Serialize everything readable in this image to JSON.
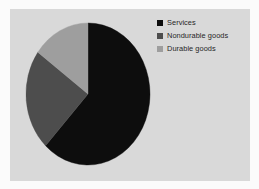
{
  "figure": {
    "background_color": "#fbfbfb",
    "plot_background_color": "#d9d9d9"
  },
  "legend": {
    "position": "top-right",
    "entries": [
      {
        "label": "Services",
        "color": "#0d0d0d",
        "swatch_icon": "square-swatch-icon"
      },
      {
        "label": "Nondurable goods",
        "color": "#4d4d4d",
        "swatch_icon": "square-swatch-icon"
      },
      {
        "label": "Durable goods",
        "color": "#9e9e9e",
        "swatch_icon": "square-swatch-icon"
      }
    ]
  },
  "chart_data": {
    "type": "pie",
    "title": "",
    "subtitle": "",
    "xlabel": "",
    "ylabel": "",
    "grid": false,
    "legend_position": "top-right",
    "start_angle_deg": 90,
    "direction": "clockwise",
    "categories": [
      "Services",
      "Nondurable goods",
      "Durable goods"
    ],
    "values": [
      62,
      23,
      15
    ],
    "units": "percent",
    "colors": [
      "#0d0d0d",
      "#4d4d4d",
      "#9e9e9e"
    ],
    "slices": [
      {
        "label": "Services",
        "value": 62,
        "color": "#0d0d0d",
        "start_angle_deg": 0,
        "end_angle_deg": 223.2
      },
      {
        "label": "Nondurable goods",
        "value": 23,
        "color": "#4d4d4d",
        "start_angle_deg": 223.2,
        "end_angle_deg": 306.0
      },
      {
        "label": "Durable goods",
        "value": 15,
        "color": "#9e9e9e",
        "start_angle_deg": 306.0,
        "end_angle_deg": 360.0
      }
    ]
  }
}
